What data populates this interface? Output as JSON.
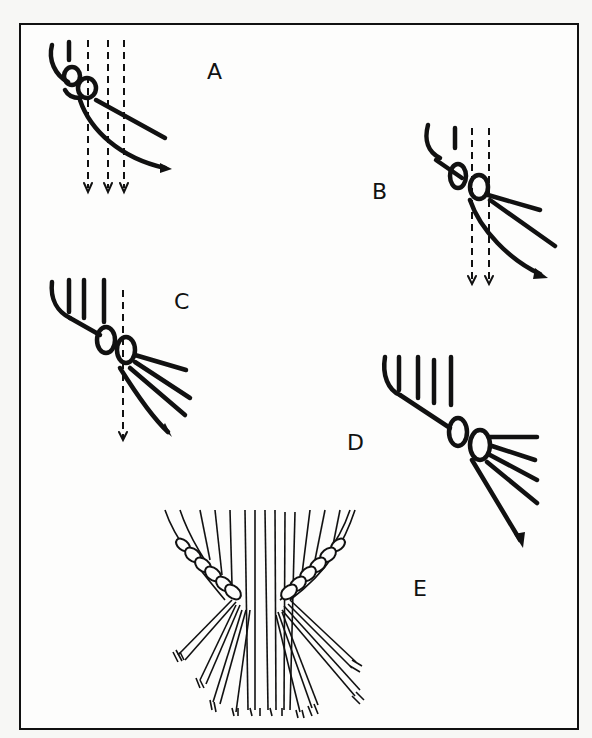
{
  "figure": {
    "panels": [
      {
        "id": "A",
        "label": "A",
        "step": 1
      },
      {
        "id": "B",
        "label": "B",
        "step": 2
      },
      {
        "id": "C",
        "label": "C",
        "step": 3
      },
      {
        "id": "D",
        "label": "D",
        "step": 4
      },
      {
        "id": "E",
        "label": "E",
        "step": 5
      }
    ],
    "colors": {
      "ink": "#111111",
      "paper": "#fdfdfc"
    }
  }
}
